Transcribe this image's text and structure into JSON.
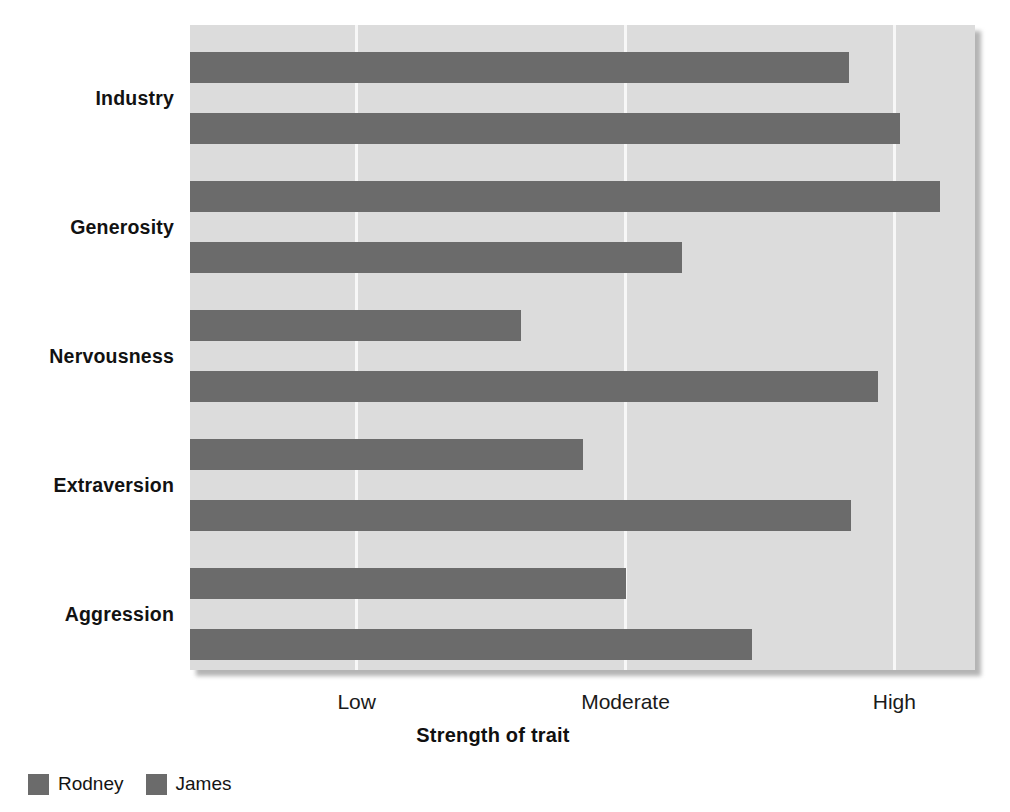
{
  "chart_data": {
    "type": "bar",
    "orientation": "horizontal",
    "title": "",
    "xlabel": "Strength of trait",
    "ylabel": "",
    "categories": [
      "Industry",
      "Generosity",
      "Nervousness",
      "Extraversion",
      "Aggression"
    ],
    "xtick_labels": [
      "Low",
      "Moderate",
      "High"
    ],
    "xtick_values": [
      1,
      2,
      3
    ],
    "xlim": [
      0.38,
      3.3
    ],
    "grid": true,
    "grid_axis": "x",
    "legend": [
      "Rodney",
      "James"
    ],
    "legend_position": "below-left",
    "series": [
      {
        "name": "Rodney",
        "values": [
          2.83,
          3.17,
          1.61,
          1.84,
          2.0
        ]
      },
      {
        "name": "James",
        "values": [
          3.02,
          2.21,
          2.94,
          2.84,
          2.47
        ]
      }
    ],
    "colors": {
      "bar": "#6b6b6b",
      "plot_background": "#dcdcdc",
      "gridline": "#f7f7f7",
      "page_background": "#ffffff",
      "text": "#121212"
    }
  },
  "labels": {
    "cat_0": "Industry",
    "cat_1": "Generosity",
    "cat_2": "Nervousness",
    "cat_3": "Extraversion",
    "cat_4": "Aggression",
    "tick_0": "Low",
    "tick_1": "Moderate",
    "tick_2": "High",
    "axis_title": "Strength of trait",
    "legend_0": "Rodney",
    "legend_1": "James"
  }
}
